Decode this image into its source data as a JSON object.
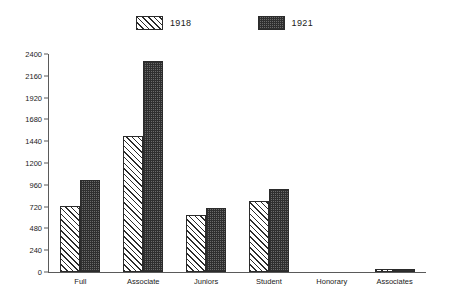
{
  "chart_data": {
    "type": "bar",
    "title": "",
    "subtitle": "",
    "xlabel": "",
    "ylabel": "",
    "categories": [
      "Full",
      "Associate",
      "Juniors",
      "Student",
      "Honorary",
      "Associates"
    ],
    "series": [
      {
        "name": "1918",
        "pattern": "diagonal-hatch",
        "color": "#ffffff",
        "values": [
          730,
          1500,
          630,
          780,
          0,
          35
        ]
      },
      {
        "name": "1921",
        "pattern": "crosshatch-dark",
        "color": "#6a6a6a",
        "values": [
          1010,
          2320,
          700,
          915,
          0,
          35
        ]
      }
    ],
    "ylim": [
      0,
      2400
    ],
    "yticks": [
      0,
      240,
      480,
      720,
      960,
      1200,
      1440,
      1680,
      1920,
      2160,
      2400
    ],
    "ytick_labels": [
      "0",
      "240",
      "480",
      "720",
      "960",
      "1200",
      "1440",
      "1680",
      "1920",
      "2160",
      "2400"
    ],
    "grid": false,
    "legend_position": "top-center"
  }
}
